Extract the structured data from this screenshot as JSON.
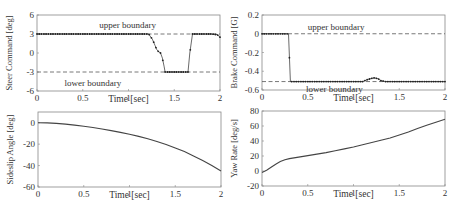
{
  "chart_data": [
    {
      "id": "steer",
      "type": "line",
      "frame": {
        "x0": 37,
        "y0": 15,
        "x1": 220,
        "y1": 91
      },
      "xlabel": "Time [sec]",
      "ylabel": "Steer Command [deg]",
      "xlim": [
        0,
        2
      ],
      "ylim": [
        -6,
        6
      ],
      "xticks": [
        0,
        0.5,
        1,
        1.5,
        2
      ],
      "xtick_labels": [
        "0",
        "0.5",
        "1",
        "1.5",
        "2"
      ],
      "yticks": [
        -6,
        -3,
        0,
        3,
        6
      ],
      "ytick_labels": [
        "-6",
        "-3",
        "0",
        "3",
        "6"
      ],
      "grid": false,
      "boundaries": [
        {
          "name": "upper boundary",
          "y": 3,
          "label_x": 0.68,
          "label_y": 4.5
        },
        {
          "name": "lower boundary",
          "y": -3,
          "label_x": 0.3,
          "label_y": -4.7
        }
      ],
      "series": [
        {
          "name": "steer command",
          "style": "dotted-markers",
          "x": [
            0,
            0.2,
            0.4,
            0.6,
            0.8,
            1.0,
            1.2,
            1.22,
            1.26,
            1.29,
            1.31,
            1.33,
            1.35,
            1.37,
            1.39,
            1.4,
            1.45,
            1.5,
            1.55,
            1.6,
            1.65,
            1.67,
            1.7,
            1.8,
            1.9,
            1.97,
            2.0
          ],
          "y": [
            3,
            3,
            3,
            3,
            3,
            3,
            3,
            3,
            2.2,
            1.2,
            0.5,
            0.2,
            0,
            -0.8,
            -2.2,
            -3,
            -3,
            -3,
            -3,
            -3,
            -3,
            0,
            3,
            3,
            3,
            2.9,
            2.5
          ]
        }
      ]
    },
    {
      "id": "brake",
      "type": "line",
      "frame": {
        "x0": 262,
        "y0": 15,
        "x1": 445,
        "y1": 90
      },
      "xlabel": "Time [sec]",
      "ylabel": "Brake Command [G]",
      "xlim": [
        0,
        2
      ],
      "ylim": [
        -0.6,
        0.2
      ],
      "xticks": [
        0,
        0.5,
        1,
        1.5,
        2
      ],
      "xtick_labels": [
        "0",
        "0.5",
        "1",
        "1.5",
        "2"
      ],
      "yticks": [
        -0.6,
        -0.4,
        -0.2,
        0,
        0.2
      ],
      "ytick_labels": [
        "-0.6",
        "-0.4",
        "-0.2",
        "0",
        "0.2"
      ],
      "grid": false,
      "boundaries": [
        {
          "name": "upper boundary",
          "y": 0,
          "label_x": 0.5,
          "label_y": 0.07
        },
        {
          "name": "lower boundary",
          "y": -0.51,
          "label_x": 0.48,
          "label_y": -0.59
        }
      ],
      "series": [
        {
          "name": "brake command",
          "style": "dotted-markers",
          "x": [
            0,
            0.1,
            0.2,
            0.29,
            0.31,
            0.5,
            0.8,
            1.0,
            1.1,
            1.15,
            1.2,
            1.23,
            1.27,
            1.3,
            1.35,
            1.5,
            1.8,
            2.0
          ],
          "y": [
            0,
            0,
            0,
            0,
            -0.51,
            -0.51,
            -0.51,
            -0.51,
            -0.51,
            -0.49,
            -0.475,
            -0.47,
            -0.48,
            -0.5,
            -0.51,
            -0.51,
            -0.51,
            -0.51
          ]
        }
      ]
    },
    {
      "id": "sideslip",
      "type": "line",
      "frame": {
        "x0": 38,
        "y0": 112,
        "x1": 221,
        "y1": 187
      },
      "xlabel": "Time [sec]",
      "ylabel": "Sideslip Angle [deg]",
      "xlim": [
        0,
        2
      ],
      "ylim": [
        -60,
        10
      ],
      "xticks": [
        0,
        0.5,
        1,
        1.5,
        2
      ],
      "xtick_labels": [
        "0",
        "0.5",
        "1",
        "1.5",
        "2"
      ],
      "yticks": [
        -60,
        -40,
        -20,
        0
      ],
      "ytick_labels": [
        "-60",
        "-40",
        "-20",
        "0"
      ],
      "grid": false,
      "boundaries": [],
      "series": [
        {
          "name": "sideslip angle",
          "style": "solid",
          "x": [
            0,
            0.1,
            0.2,
            0.3,
            0.4,
            0.5,
            0.6,
            0.7,
            0.8,
            0.9,
            1.0,
            1.1,
            1.2,
            1.3,
            1.4,
            1.5,
            1.6,
            1.7,
            1.8,
            1.9,
            2.0
          ],
          "y": [
            0,
            -0.2,
            -0.6,
            -1.3,
            -2.2,
            -3.3,
            -4.5,
            -5.9,
            -7.4,
            -9.0,
            -10.8,
            -12.8,
            -15.0,
            -17.5,
            -20.3,
            -23.5,
            -27.0,
            -31.0,
            -35.3,
            -40.0,
            -45.0
          ]
        }
      ]
    },
    {
      "id": "yawrate",
      "type": "line",
      "frame": {
        "x0": 262,
        "y0": 111,
        "x1": 445,
        "y1": 186
      },
      "xlabel": "Time [sec]",
      "ylabel": "Yaw Rate [deg/s]",
      "xlim": [
        0,
        2
      ],
      "ylim": [
        -20,
        80
      ],
      "xticks": [
        0,
        0.5,
        1,
        1.5,
        2
      ],
      "xtick_labels": [
        "0",
        "0.5",
        "1",
        "1.5",
        "2"
      ],
      "yticks": [
        -20,
        0,
        20,
        40,
        60,
        80
      ],
      "ytick_labels": [
        "-20",
        "0",
        "20",
        "40",
        "60",
        "80"
      ],
      "grid": false,
      "boundaries": [],
      "series": [
        {
          "name": "yaw rate",
          "style": "solid",
          "x": [
            0,
            0.05,
            0.1,
            0.15,
            0.2,
            0.25,
            0.3,
            0.4,
            0.5,
            0.6,
            0.7,
            0.8,
            0.9,
            1.0,
            1.1,
            1.2,
            1.3,
            1.4,
            1.5,
            1.6,
            1.7,
            1.8,
            1.9,
            2.0
          ],
          "y": [
            -2,
            1,
            5,
            9,
            12.5,
            15,
            16.5,
            18.5,
            20.5,
            22.5,
            24.5,
            27,
            29.5,
            32,
            35,
            38,
            41,
            44,
            48,
            52,
            56.5,
            61,
            65,
            69
          ]
        }
      ]
    }
  ]
}
